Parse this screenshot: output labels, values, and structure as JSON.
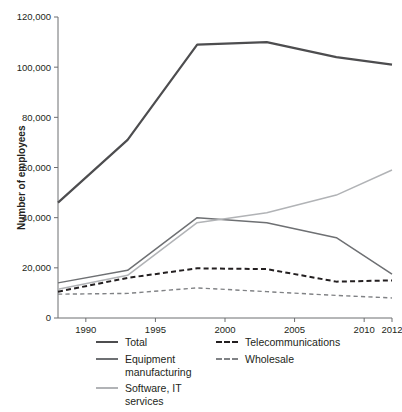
{
  "chart_data": {
    "type": "line",
    "title": "",
    "xlabel": "",
    "ylabel": "Number of employees",
    "xlim": [
      1988,
      2012
    ],
    "ylim": [
      0,
      120000
    ],
    "grid": false,
    "legend_position": "bottom",
    "x": [
      1988,
      1993,
      1998,
      2003,
      2008,
      2012
    ],
    "xticks": [
      "1990",
      "1995",
      "2000",
      "2005",
      "2010",
      "2012"
    ],
    "xtick_values": [
      1990,
      1995,
      2000,
      2005,
      2010,
      2012
    ],
    "yticks": [
      "0",
      "20,000",
      "40,000",
      "60,000",
      "80,000",
      "100,000",
      "120,000"
    ],
    "ytick_values": [
      0,
      20000,
      40000,
      60000,
      80000,
      100000,
      120000
    ],
    "series": [
      {
        "name": "Total",
        "values": [
          46000,
          71000,
          109000,
          110000,
          104000,
          101000
        ],
        "color": "#4d4d4f",
        "style": "solid",
        "width": 2.2
      },
      {
        "name": "Equipment manufacturing",
        "values": [
          14000,
          19000,
          40000,
          38000,
          32000,
          17500
        ],
        "color": "#6e7073",
        "style": "solid",
        "width": 1.5
      },
      {
        "name": "Software, IT services",
        "values": [
          11500,
          17000,
          38000,
          42000,
          49000,
          59000
        ],
        "color": "#b1b3b6",
        "style": "solid",
        "width": 1.5
      },
      {
        "name": "Telecommunications",
        "values": [
          10500,
          16000,
          19800,
          19500,
          14500,
          15000
        ],
        "color": "#231f20",
        "style": "dashed",
        "width": 2.0
      },
      {
        "name": "Wholesale",
        "values": [
          9500,
          9800,
          12000,
          10500,
          9000,
          8000
        ],
        "color": "#808285",
        "style": "dashed",
        "width": 1.4
      }
    ]
  },
  "axes": {
    "y_title": "Number of employees",
    "zero_label": "0"
  },
  "legend": {
    "left_column": [
      {
        "label": "Total",
        "key": "total"
      },
      {
        "label": "Equipment\nmanufacturing",
        "key": "equipment-manufacturing"
      },
      {
        "label": "Software, IT services",
        "key": "software-it-services"
      }
    ],
    "right_column": [
      {
        "label": "Telecommunications",
        "key": "telecommunications"
      },
      {
        "label": "Wholesale",
        "key": "wholesale"
      }
    ]
  }
}
